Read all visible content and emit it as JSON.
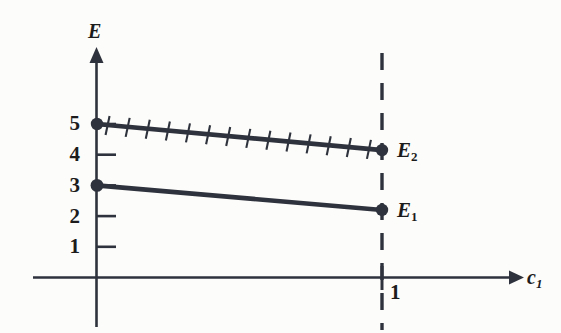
{
  "figure": {
    "background_color": "#fcfcfa",
    "ink_color": "#2e323c",
    "text_color": "#1c1c1c",
    "width": 561,
    "height": 333
  },
  "axes": {
    "y_label": "E",
    "x_label_base": "c",
    "x_label_sub": "1",
    "y_ticks": [
      "5",
      "4",
      "3",
      "2",
      "1"
    ],
    "x_tick_label": "1"
  },
  "curves": {
    "upper": {
      "name_base": "E",
      "name_sub": "2",
      "hatched": true,
      "hatch_count": 14
    },
    "lower": {
      "name_base": "E",
      "name_sub": "1",
      "hatched": false
    }
  },
  "chart_data": {
    "type": "line",
    "title": "",
    "xlabel": "c_1",
    "ylabel": "E",
    "xlim": [
      0,
      1.45
    ],
    "ylim": [
      0,
      5.8
    ],
    "grid": false,
    "legend": "inline-end-labels",
    "x": [
      0,
      1
    ],
    "series": [
      {
        "name": "E_2",
        "values": [
          5.0,
          4.15
        ],
        "style": "hatched-solid",
        "endpoint_markers": [
          true,
          true
        ],
        "label_at_end": "E_2"
      },
      {
        "name": "E_1",
        "values": [
          3.0,
          2.2
        ],
        "style": "solid",
        "endpoint_markers": [
          true,
          true
        ],
        "label_at_end": "E_1"
      }
    ],
    "annotations": [
      {
        "kind": "vertical-dashed-line",
        "x": 1,
        "label": "1"
      },
      {
        "kind": "crossing-point",
        "x_approx": 0.52,
        "y_approx": 3.55
      }
    ],
    "y_tick_values": [
      1,
      2,
      3,
      4,
      5
    ],
    "x_tick_values": [
      1
    ]
  }
}
